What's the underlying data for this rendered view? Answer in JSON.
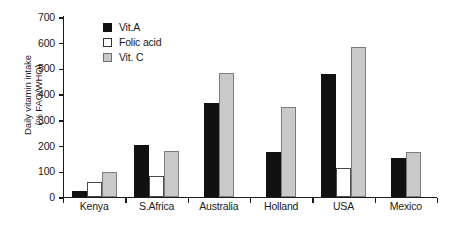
{
  "chart_data": {
    "type": "bar",
    "title": "",
    "xlabel": "",
    "ylabel": "Daily vitamin intake\n(% FAO/WHO)",
    "ylim": [
      0,
      700
    ],
    "yticks": [
      0,
      100,
      200,
      300,
      400,
      500,
      600,
      700
    ],
    "grid": false,
    "legend_position": "upper-left-inside",
    "categories": [
      "Kenya",
      "S.Africa",
      "Australia",
      "Holland",
      "USA",
      "Mexico"
    ],
    "series": [
      {
        "name": "Vit.A",
        "color": "#111111",
        "values": [
          20,
          200,
          365,
          172,
          475,
          152
        ]
      },
      {
        "name": "Folic acid",
        "color": "#ffffff",
        "values": [
          55,
          80,
          0,
          0,
          110,
          0
        ]
      },
      {
        "name": "Vit. C",
        "color": "#c9c9c9",
        "values": [
          95,
          177,
          480,
          348,
          582,
          172
        ]
      }
    ]
  },
  "legend": {
    "items": [
      {
        "label": "Vit.A"
      },
      {
        "label": "Folic acid"
      },
      {
        "label": "Vit. C"
      }
    ]
  },
  "caption": {
    "text": ""
  }
}
